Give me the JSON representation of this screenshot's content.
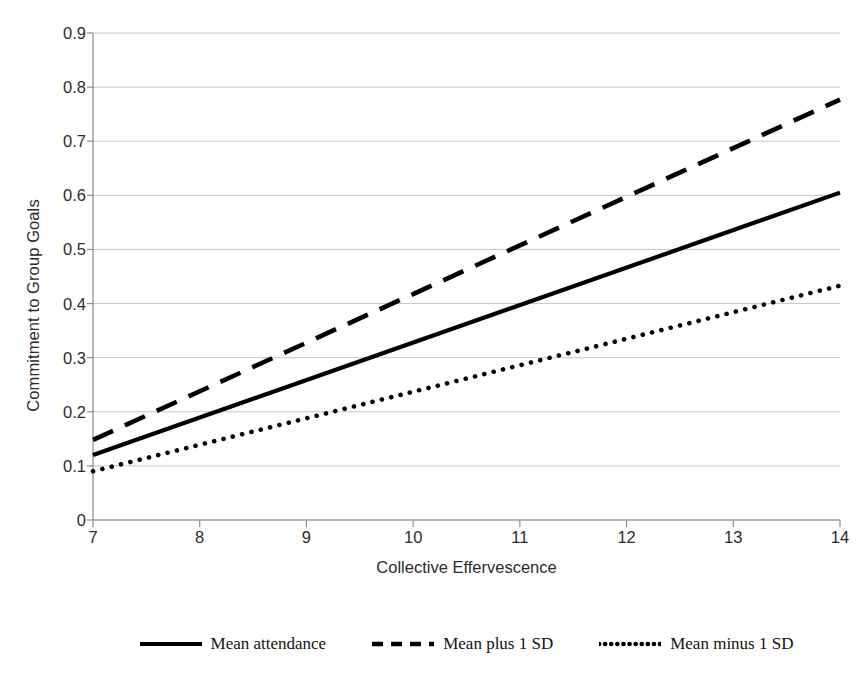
{
  "chart_data": {
    "type": "line",
    "title": "",
    "xlabel": "Collective Effervescence",
    "ylabel": "Commitment to Group Goals",
    "xlim": [
      7,
      14
    ],
    "ylim": [
      0,
      0.9
    ],
    "xticks": [
      "7",
      "8",
      "9",
      "10",
      "11",
      "12",
      "13",
      "14"
    ],
    "xtick_values": [
      7,
      8,
      9,
      10,
      11,
      12,
      13,
      14
    ],
    "yticks": [
      "0",
      "0.1",
      "0.2",
      "0.3",
      "0.4",
      "0.5",
      "0.6",
      "0.7",
      "0.8",
      "0.9"
    ],
    "ytick_values": [
      0,
      0.1,
      0.2,
      0.3,
      0.4,
      0.5,
      0.6,
      0.7,
      0.8,
      0.9
    ],
    "grid": "horizontal",
    "legend_position": "bottom",
    "x": [
      7,
      14
    ],
    "series": [
      {
        "name": "Mean attendance",
        "style": "solid",
        "color": "#000000",
        "values": [
          0.12,
          0.605
        ]
      },
      {
        "name": "Mean plus 1 SD",
        "style": "dashed",
        "color": "#000000",
        "values": [
          0.148,
          0.777
        ]
      },
      {
        "name": "Mean minus 1 SD",
        "style": "dotted",
        "color": "#000000",
        "values": [
          0.09,
          0.433
        ]
      }
    ]
  },
  "axis": {
    "x_title": "Collective Effervescence",
    "y_title": "Commitment to Group Goals"
  },
  "legend": {
    "entries": [
      {
        "label": "Mean attendance",
        "style": "solid"
      },
      {
        "label": "Mean plus 1 SD",
        "style": "dashed"
      },
      {
        "label": "Mean minus 1 SD",
        "style": "dotted"
      }
    ]
  },
  "colors": {
    "line": "#000000",
    "gridline": "#c6c6c6",
    "axis": "#8c8c8c",
    "text": "#2b2b2b",
    "background": "#ffffff"
  }
}
